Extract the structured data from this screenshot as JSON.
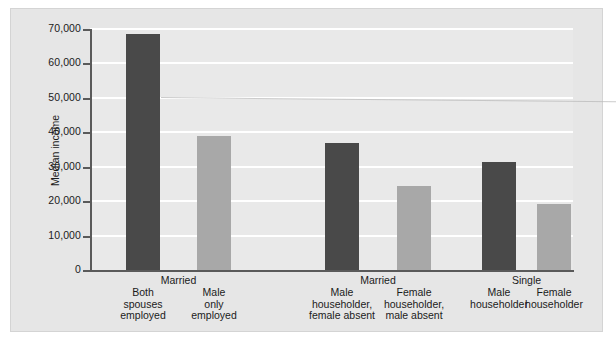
{
  "chart_data": {
    "type": "bar",
    "title": "",
    "xlabel": "",
    "ylabel": "Median income",
    "ylim": [
      0,
      70000
    ],
    "ytick_labels": [
      "70,000",
      "60,000",
      "50,000",
      "40,000",
      "30,000",
      "20,000",
      "10,000",
      "0"
    ],
    "ytick_values": [
      70000,
      60000,
      50000,
      40000,
      30000,
      20000,
      10000,
      0
    ],
    "grid": "horizontal-white-gridlines",
    "legend": "none",
    "categories": [
      "Both spouses employed",
      "Male only employed",
      "Male householder, female absent",
      "Female householder, male absent",
      "Male householder",
      "Female householder"
    ],
    "values": [
      68500,
      39000,
      36800,
      24400,
      31300,
      19100
    ],
    "bar_colors": [
      "#494949",
      "#a8a8a8",
      "#494949",
      "#a8a8a8",
      "#494949",
      "#a8a8a8"
    ],
    "groups": [
      {
        "label": "Married",
        "members": [
          "Both spouses employed",
          "Male only employed"
        ]
      },
      {
        "label": "Married",
        "members": [
          "Male householder, female absent",
          "Female householder, male absent"
        ]
      },
      {
        "label": "Single",
        "members": [
          "Male householder",
          "Female householder"
        ]
      }
    ]
  },
  "axis": {
    "y_title": "Median income"
  },
  "category_lines": [
    "Both\nspouses\nemployed",
    "Male\nonly\nemployed",
    "Male\nhouseholder,\nfemale absent",
    "Female\nhouseholder,\nmale absent",
    "Male\nhouseholder",
    "Female\nhouseholder"
  ],
  "group_labels": [
    "Married",
    "Married",
    "Single"
  ],
  "colors": {
    "bar_dark": "#494949",
    "bar_light": "#a8a8a8",
    "plot_background": "#e9e9e9",
    "figure_background": "#e6e6e6",
    "gridline": "#ffffff",
    "axis": "#5a5a5a",
    "text": "#1b1b1b"
  }
}
